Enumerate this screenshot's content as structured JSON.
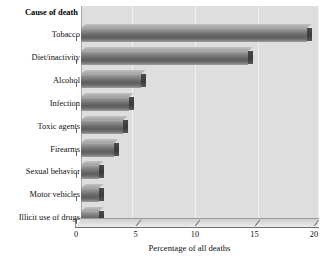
{
  "chart_data": {
    "type": "bar",
    "orientation": "horizontal",
    "title": "",
    "legend_header": "Cause of death",
    "categories": [
      "Tobacco",
      "Diet/inactivity",
      "Alcohol",
      "Infection",
      "Toxic agents",
      "Firearms",
      "Sexual behavior",
      "Motor vehicles",
      "Illicit use of drugs"
    ],
    "values": [
      19.0,
      14.0,
      5.0,
      4.0,
      3.5,
      2.8,
      1.5,
      1.5,
      1.5
    ],
    "xlabel": "Percentage of all deaths",
    "ylabel": "Cause of death",
    "xlim": [
      0,
      20
    ],
    "xticks": [
      0,
      5,
      10,
      15,
      20
    ],
    "xtick_labels": [
      "0",
      "5",
      "10",
      "15",
      "20"
    ],
    "grid": true,
    "legend_position": "none",
    "bar_color": "#6e6e6e",
    "plot_background": "#dedede",
    "page_background": "#ffffff"
  },
  "axis": {
    "x_title": "Percentage of all deaths",
    "ticks": [
      {
        "label": "0"
      },
      {
        "label": "5"
      },
      {
        "label": "10"
      },
      {
        "label": "15"
      },
      {
        "label": "20"
      }
    ]
  },
  "header": {
    "label": "Cause of death"
  },
  "rows": [
    {
      "label": "Tobacco",
      "value": 19.0
    },
    {
      "label": "Diet/inactivity",
      "value": 14.0
    },
    {
      "label": "Alcohol",
      "value": 5.0
    },
    {
      "label": "Infection",
      "value": 4.0
    },
    {
      "label": "Toxic agents",
      "value": 3.5
    },
    {
      "label": "Firearms",
      "value": 2.8
    },
    {
      "label": "Sexual behavior",
      "value": 1.5
    },
    {
      "label": "Motor vehicles",
      "value": 1.5
    },
    {
      "label": "Illicit use of drugs",
      "value": 1.5
    }
  ]
}
